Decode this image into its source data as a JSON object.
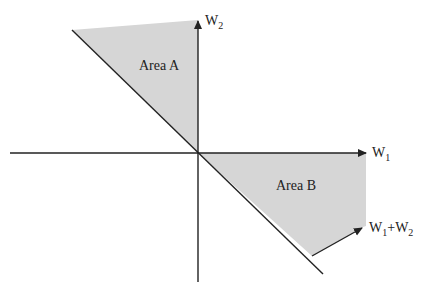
{
  "diagram": {
    "type": "vector-region-diagram",
    "axes": {
      "x_label": "W",
      "x_label_sub": "1",
      "y_label": "W",
      "y_label_sub": "2"
    },
    "regions": [
      {
        "name": "Area A",
        "label": "Area A",
        "fill": "#d6d6d6"
      },
      {
        "name": "Area B",
        "label": "Area B",
        "fill": "#d6d6d6"
      }
    ],
    "vector": {
      "label_a": "W",
      "label_a_sub": "1",
      "label_plus": "+",
      "label_b": "W",
      "label_b_sub": "2"
    },
    "colors": {
      "line": "#222222",
      "region_fill": "#d6d6d6",
      "background": "#ffffff"
    }
  }
}
